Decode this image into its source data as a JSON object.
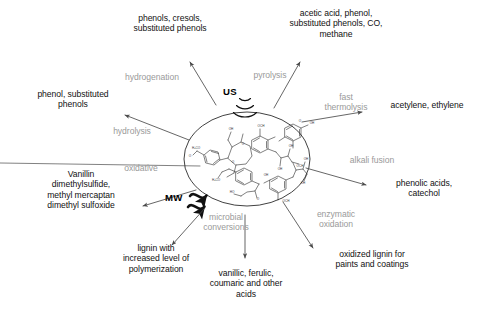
{
  "figure": {
    "center": {
      "substrate_label": "lignin molecular structure",
      "energy_sources": [
        {
          "id": "ultrasound",
          "label": "US",
          "symbol": "concentric-arc-waves"
        },
        {
          "id": "microwave",
          "label": "MW",
          "symbol": "squiggly-wave-arrows"
        }
      ]
    },
    "pathways": [
      {
        "id": "hydrogenation",
        "process": "hydrogenation",
        "product": "phenols, cresols,\nsubstituted phenols"
      },
      {
        "id": "pyrolysis",
        "process": "pyrolysis",
        "product": "acetic acid, phenol,\nsubstituted phenols, CO,\nmethane"
      },
      {
        "id": "fast-thermolysis",
        "process": "fast\nthermolysis",
        "product": "acetylene, ethylene"
      },
      {
        "id": "alkali-fusion",
        "process": "alkali fusion",
        "product": "phenolic acids,\ncatechol"
      },
      {
        "id": "enzymatic-oxidation",
        "process": "enzymatic\noxidation",
        "product": "oxidized lignin for\npaints and coatings"
      },
      {
        "id": "microbial-conversions",
        "process": "microbial\nconversions",
        "product": "vanillic, ferulic,\ncoumaric and other\nacids"
      },
      {
        "id": "oxidative",
        "process": "oxidative",
        "product": "Vanillin\ndimethylsulfide,\nmethyl mercaptan\ndimethyl sulfoxide"
      },
      {
        "id": "depolymerization",
        "process": "",
        "product": "lignin with\nincreased level of\npolymerization"
      },
      {
        "id": "hydrolysis",
        "process": "hydrolysis",
        "product": "phenol, substituted\nphenols"
      }
    ],
    "colors": {
      "product_text": "#111111",
      "process_text": "#9a9a9a",
      "energy_text": "#000000",
      "arrow_stroke": "#4a4a4a",
      "oval_stroke": "#2b2b2b",
      "molecule_stroke": "#333333",
      "background": "#ffffff"
    }
  }
}
